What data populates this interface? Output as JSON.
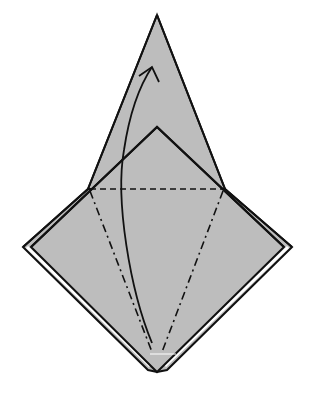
{
  "diagram": {
    "type": "origami-fold-diagram",
    "colors": {
      "background": "#ffffff",
      "paper_fill": "#bdbdbd",
      "line": "#111111",
      "gap": "#ffffff"
    },
    "shapes": {
      "top_kite_apex": [
        157,
        15
      ],
      "inner_peak": [
        157,
        127
      ],
      "left_junction": [
        88,
        189
      ],
      "right_junction": [
        225,
        189
      ],
      "left_corner_outer": [
        23,
        247
      ],
      "left_corner_inner": [
        31,
        247
      ],
      "right_corner_outer": [
        292,
        247
      ],
      "right_corner_inner": [
        284,
        247
      ],
      "bottom_tip": [
        157,
        372
      ],
      "left_flap_tip": [
        148,
        370
      ],
      "right_flap_tip": [
        167,
        370
      ]
    },
    "fold_lines": [
      {
        "name": "valley-fold-horizontal",
        "style": "dashed",
        "from": [
          90,
          189
        ],
        "to": [
          223,
          189
        ]
      },
      {
        "name": "mountain-fold-left",
        "style": "dash-dot",
        "from": [
          90,
          191
        ],
        "to": [
          152,
          352
        ]
      },
      {
        "name": "mountain-fold-right",
        "style": "dash-dot",
        "from": [
          223,
          191
        ],
        "to": [
          162,
          352
        ]
      }
    ],
    "arrow": {
      "name": "fold-up-arrow",
      "from": [
        152,
        343
      ],
      "via": [
        122,
        190
      ],
      "to": [
        152,
        67
      ]
    }
  }
}
